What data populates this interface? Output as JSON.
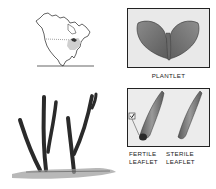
{
  "figure": {
    "map": {
      "label": "North America range map",
      "icon": "range-map-icon"
    },
    "plantlet": {
      "caption": "Plantlet",
      "icon": "plantlet-icon"
    },
    "plant": {
      "label": "Whole plant sketch",
      "icon": "plant-illustration-icon"
    },
    "leaflets": {
      "fertile_caption_line1": "Fertile",
      "fertile_caption_line2": "leaflet",
      "sterile_caption_line1": "Sterile",
      "sterile_caption_line2": "leaflet",
      "marker_icon": "checkmark-box-icon"
    },
    "colors": {
      "ink": "#222222",
      "panel": "#e9e9e9",
      "range_shading": "#cfcfcf"
    }
  }
}
